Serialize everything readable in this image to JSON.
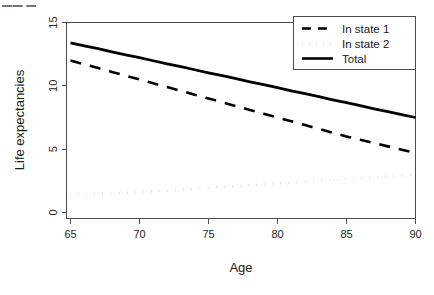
{
  "artifact": {
    "top_clipped_text": "▬▬ ▬"
  },
  "chart_data": {
    "type": "line",
    "title": "",
    "xlabel": "Age",
    "ylabel": "Life expectancies",
    "xlim": [
      63.5,
      91.5
    ],
    "ylim": [
      0,
      15.6
    ],
    "xticks": [
      65,
      70,
      75,
      80,
      85,
      90
    ],
    "yticks": [
      0,
      5,
      10,
      15
    ],
    "xtick_labels": [
      "65",
      "70",
      "75",
      "80",
      "85",
      "90"
    ],
    "ytick_labels": [
      "0",
      "5",
      "10",
      "15"
    ],
    "grid": false,
    "legend_position": "top-right",
    "x": [
      65,
      66,
      67,
      68,
      69,
      70,
      71,
      72,
      73,
      74,
      75,
      76,
      77,
      78,
      79,
      80,
      81,
      82,
      83,
      84,
      85,
      86,
      87,
      88,
      89,
      90
    ],
    "series": [
      {
        "name": "In state 1",
        "style": "dashed",
        "color": "#000000",
        "values": [
          12.0,
          11.7,
          11.4,
          11.1,
          10.8,
          10.5,
          10.2,
          9.9,
          9.6,
          9.3,
          9.0,
          8.7,
          8.4,
          8.1,
          7.8,
          7.5,
          7.2,
          6.9,
          6.6,
          6.3,
          6.0,
          5.74,
          5.48,
          5.22,
          4.96,
          4.7
        ]
      },
      {
        "name": "In state 2",
        "style": "dotted",
        "color": "#000000",
        "values": [
          1.4,
          1.43,
          1.47,
          1.51,
          1.56,
          1.61,
          1.67,
          1.73,
          1.8,
          1.87,
          1.94,
          2.01,
          2.08,
          2.15,
          2.22,
          2.29,
          2.36,
          2.43,
          2.5,
          2.57,
          2.64,
          2.71,
          2.78,
          2.85,
          2.92,
          3.0
        ]
      },
      {
        "name": "Total",
        "style": "solid",
        "color": "#000000",
        "values": [
          13.4,
          13.16,
          12.93,
          12.69,
          12.45,
          12.22,
          11.98,
          11.74,
          11.51,
          11.27,
          11.03,
          10.8,
          10.56,
          10.32,
          10.09,
          9.85,
          9.61,
          9.38,
          9.14,
          8.9,
          8.67,
          8.43,
          8.19,
          7.96,
          7.72,
          7.5
        ]
      }
    ],
    "legend": [
      {
        "label": "In state 1",
        "style": "dashed"
      },
      {
        "label": "In state 2",
        "style": "dotted"
      },
      {
        "label": "Total",
        "style": "solid"
      }
    ]
  }
}
